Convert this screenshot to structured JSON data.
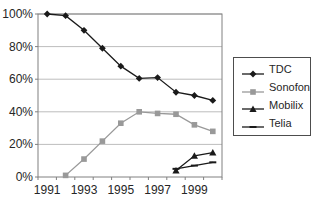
{
  "chart_data": {
    "type": "line",
    "title": "",
    "xlabel": "",
    "ylabel": "",
    "x": [
      1991,
      1992,
      1993,
      1994,
      1995,
      1996,
      1997,
      1998,
      1999,
      2000
    ],
    "x_tick_labels": [
      "1991",
      "1993",
      "1995",
      "1997",
      "1999"
    ],
    "ylim": [
      0,
      100
    ],
    "y_ticks": [
      0,
      20,
      40,
      60,
      80,
      100
    ],
    "y_tick_labels": [
      "0%",
      "20%",
      "40%",
      "60%",
      "80%",
      "100%"
    ],
    "grid": true,
    "legend_position": "right",
    "series": [
      {
        "name": "TDC",
        "marker": "diamond",
        "color": "#1a1a1a",
        "values": [
          100,
          99,
          90,
          79,
          68,
          60.5,
          61,
          52,
          50,
          47
        ]
      },
      {
        "name": "Sonofon",
        "marker": "square",
        "color": "#999999",
        "values": [
          null,
          1,
          11,
          22,
          33,
          40,
          39,
          38.5,
          32,
          28
        ]
      },
      {
        "name": "Mobilix",
        "marker": "triangle",
        "color": "#1a1a1a",
        "values": [
          null,
          null,
          null,
          null,
          null,
          null,
          null,
          4,
          13,
          15
        ]
      },
      {
        "name": "Telia",
        "marker": "dash",
        "color": "#1a1a1a",
        "values": [
          null,
          null,
          null,
          null,
          null,
          null,
          null,
          5,
          7,
          9
        ]
      }
    ],
    "colors": {
      "grid": "#bdbdbd",
      "frame": "#808080",
      "text": "#262626",
      "background": "#ffffff"
    }
  }
}
